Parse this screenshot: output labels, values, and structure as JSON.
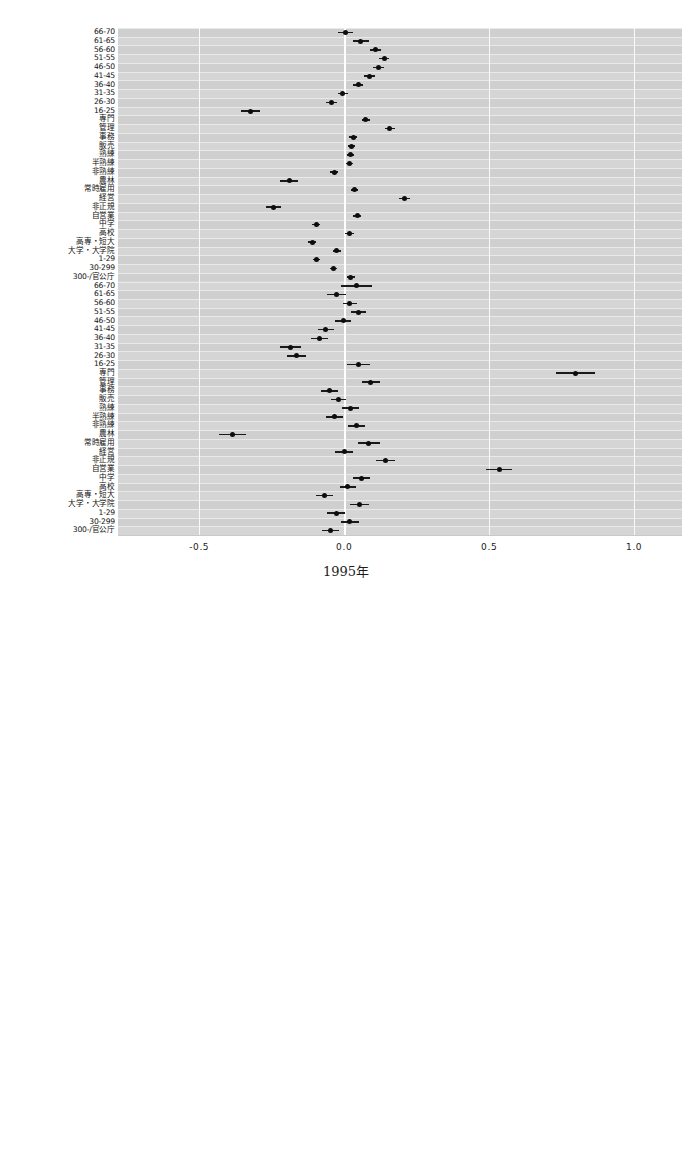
{
  "figure": {
    "x_axis": {
      "ticks": [
        "-0.5",
        "0.0",
        "0.5",
        "1.0"
      ],
      "tick_values": [
        -0.5,
        0.0,
        0.5,
        1.0
      ],
      "xlim": [
        -0.78,
        1.165
      ],
      "grid": true
    },
    "category_labels": [
      "66-70",
      "61-65",
      "56-60",
      "51-55",
      "46-50",
      "41-45",
      "36-40",
      "31-35",
      "26-30",
      "16-25",
      "専門",
      "管理",
      "事務",
      "販売",
      "熟練",
      "半熟練",
      "非熟練",
      "農林",
      "常時雇用",
      "経営",
      "非正規",
      "自営業",
      "中学",
      "高校",
      "高専・短大",
      "大学・大学院",
      "1-29",
      "30-299",
      "300-/官公庁"
    ]
  },
  "chart_data": [
    {
      "type": "scatter",
      "title": "1995年",
      "xlabel": "",
      "ylabel": "",
      "xlim": [
        -0.78,
        1.165
      ],
      "xticks": [
        -0.5,
        0.0,
        0.5,
        1.0
      ],
      "grid": true,
      "orientation": "horizontal-forest-plot",
      "categories": [
        "66-70",
        "61-65",
        "56-60",
        "51-55",
        "46-50",
        "41-45",
        "36-40",
        "31-35",
        "26-30",
        "16-25",
        "専門",
        "管理",
        "事務",
        "販売",
        "熟練",
        "半熟練",
        "非熟練",
        "農林",
        "常時雇用",
        "経営",
        "非正規",
        "自営業",
        "中学",
        "高校",
        "高専・短大",
        "大学・大学院",
        "1-29",
        "30-299",
        "300-/官公庁",
        "66-70",
        "61-65",
        "56-60",
        "51-55",
        "46-50",
        "41-45",
        "36-40",
        "31-35",
        "26-30",
        "16-25",
        "専門",
        "管理",
        "事務",
        "販売",
        "熟練",
        "半熟練",
        "非熟練",
        "農林",
        "常時雇用",
        "経営",
        "非正規",
        "自営業",
        "中学",
        "高校",
        "高専・短大",
        "大学・大学院",
        "1-29",
        "30-299",
        "300-/官公庁"
      ],
      "values": [
        0.005,
        0.057,
        0.108,
        0.138,
        0.118,
        0.088,
        0.048,
        -0.005,
        -0.043,
        -0.322,
        0.075,
        0.158,
        0.031,
        0.024,
        0.022,
        0.018,
        -0.035,
        -0.19,
        0.035,
        0.207,
        -0.243,
        0.045,
        -0.096,
        0.018,
        -0.11,
        -0.026,
        -0.095,
        -0.037,
        0.023,
        0.043,
        -0.027,
        0.02,
        0.048,
        -0.004,
        -0.063,
        -0.086,
        -0.186,
        -0.163,
        0.05,
        0.798,
        0.092,
        -0.051,
        -0.02,
        0.021,
        -0.034,
        0.042,
        -0.385,
        0.085,
        0.001,
        0.143,
        0.535,
        0.061,
        0.013,
        -0.068,
        0.052,
        -0.028,
        0.02,
        -0.048
      ],
      "ci_low": [
        -0.02,
        0.03,
        0.09,
        0.12,
        0.1,
        0.07,
        0.03,
        -0.022,
        -0.062,
        -0.355,
        0.06,
        0.14,
        0.018,
        0.012,
        0.01,
        0.006,
        -0.048,
        -0.22,
        0.022,
        0.188,
        -0.268,
        0.032,
        -0.11,
        0.002,
        -0.124,
        -0.04,
        -0.108,
        -0.05,
        0.01,
        -0.01,
        -0.06,
        -0.005,
        0.022,
        -0.03,
        -0.09,
        -0.116,
        -0.222,
        -0.196,
        0.01,
        0.73,
        0.06,
        -0.08,
        -0.046,
        -0.008,
        -0.064,
        0.012,
        -0.43,
        0.048,
        -0.03,
        0.11,
        0.49,
        0.032,
        -0.016,
        -0.098,
        0.02,
        -0.058,
        -0.01,
        -0.078
      ],
      "ci_high": [
        0.03,
        0.084,
        0.126,
        0.156,
        0.136,
        0.106,
        0.066,
        0.012,
        -0.024,
        -0.289,
        0.09,
        0.176,
        0.044,
        0.036,
        0.034,
        0.03,
        -0.022,
        -0.16,
        0.048,
        0.226,
        -0.218,
        0.058,
        -0.082,
        0.034,
        -0.096,
        -0.012,
        -0.082,
        -0.024,
        0.036,
        0.096,
        0.006,
        0.045,
        0.074,
        0.022,
        -0.036,
        -0.056,
        -0.15,
        -0.13,
        0.09,
        0.866,
        0.124,
        -0.022,
        0.006,
        0.05,
        -0.004,
        0.072,
        -0.34,
        0.122,
        0.032,
        0.176,
        0.58,
        0.09,
        0.042,
        -0.038,
        0.084,
        0.002,
        0.05,
        -0.018
      ]
    },
    {
      "type": "scatter",
      "title": "2005年",
      "xlabel": "",
      "ylabel": "",
      "xlim": [
        -0.78,
        1.165
      ],
      "xticks": [
        -0.5,
        0.0,
        0.5,
        1.0
      ],
      "grid": true,
      "orientation": "horizontal-forest-plot",
      "categories": [
        "66-70",
        "61-65",
        "56-60",
        "51-55",
        "46-50",
        "41-45",
        "36-40",
        "31-35",
        "26-30",
        "16-25",
        "専門",
        "管理",
        "事務",
        "販売",
        "熟練",
        "半熟練",
        "非熟練",
        "農林",
        "常時雇用",
        "経営",
        "非正規",
        "自営業",
        "中学",
        "高校",
        "高専・短大",
        "大学・大学院",
        "1-29",
        "30-299",
        "300-/官公庁",
        "66-70",
        "61-65",
        "56-60",
        "51-55",
        "46-50",
        "41-45",
        "36-40",
        "31-35",
        "26-30",
        "16-25",
        "専門",
        "管理",
        "事務",
        "販売",
        "熟練",
        "半熟練",
        "非熟練",
        "農林",
        "常時雇用",
        "経営",
        "非正規",
        "自営業",
        "中学",
        "高校",
        "高専・短大",
        "大学・大学院",
        "1-29",
        "30-299",
        "300-/官公庁"
      ],
      "values": [
        -0.022,
        0.063,
        0.1,
        0.068,
        0.06,
        0.084,
        0.032,
        -0.02,
        -0.07,
        -0.4,
        0.075,
        0.1,
        0.015,
        0.005,
        -0.008,
        -0.02,
        0.024,
        0.042,
        0.055,
        0.253,
        -0.248,
        0.031,
        -0.098,
        -0.025,
        -0.03,
        0.012,
        0.034,
        -0.055,
        -0.01,
        0.085,
        0.043,
        0.068,
        0.045,
        -0.013,
        0.0,
        -0.124,
        -0.016,
        0.005,
        0.055,
        0.125,
        -0.015,
        -0.015,
        0.065,
        -0.035,
        -0.045,
        0.005,
        0.035,
        -0.027,
        -0.2,
        0.09,
        0.23,
        0.045,
        0.14,
        0.355,
        0.075,
        -0.055,
        0.03,
        -0.013,
        0.18,
        -0.065
      ],
      "ci_low": [
        -0.04,
        0.05,
        0.088,
        0.056,
        0.048,
        0.072,
        0.018,
        -0.034,
        -0.084,
        -0.425,
        0.06,
        0.086,
        0.002,
        -0.008,
        -0.02,
        -0.032,
        0.008,
        0.01,
        0.04,
        0.236,
        -0.27,
        0.018,
        -0.112,
        -0.04,
        -0.044,
        -0.008,
        0.02,
        -0.07,
        -0.03,
        0.062,
        0.02,
        0.04,
        0.022,
        -0.038,
        -0.025,
        -0.154,
        -0.04,
        -0.018,
        0.034,
        0.098,
        -0.042,
        -0.042,
        0.04,
        -0.06,
        -0.07,
        -0.016,
        0.012,
        -0.05,
        -0.23,
        0.064,
        0.2,
        0.022,
        0.112,
        0.32,
        0.05,
        -0.08,
        0.006,
        -0.038,
        0.156,
        -0.088
      ],
      "ci_high": [
        -0.004,
        0.076,
        0.112,
        0.08,
        0.072,
        0.096,
        0.046,
        -0.006,
        -0.056,
        -0.375,
        0.09,
        0.114,
        0.028,
        0.018,
        0.004,
        -0.008,
        0.04,
        0.074,
        0.07,
        0.27,
        -0.226,
        0.044,
        -0.084,
        -0.01,
        -0.016,
        0.032,
        0.048,
        -0.04,
        0.01,
        0.108,
        0.066,
        0.096,
        0.068,
        0.012,
        0.025,
        -0.094,
        0.008,
        0.028,
        0.076,
        0.152,
        0.012,
        0.012,
        0.09,
        -0.01,
        -0.02,
        0.026,
        0.058,
        -0.004,
        -0.17,
        0.116,
        0.26,
        0.068,
        0.168,
        0.39,
        0.1,
        -0.03,
        0.054,
        0.012,
        0.204,
        -0.042
      ]
    }
  ]
}
